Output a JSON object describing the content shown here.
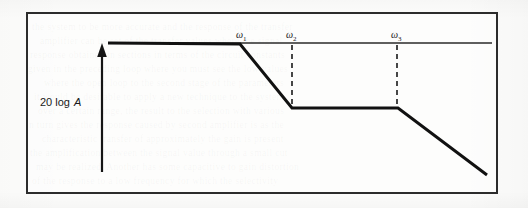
{
  "figure": {
    "kind": "asymptotic-bode-magnitude-plot",
    "y_axis_label_prefix": "20 log",
    "y_axis_label_variable": "A",
    "breakpoint_labels": [
      {
        "symbol": "ω",
        "subscript": "1"
      },
      {
        "symbol": "ω",
        "subscript": "2"
      },
      {
        "symbol": "ω",
        "subscript": "3"
      }
    ],
    "colors": {
      "ink": "#1a1a1a",
      "frame": "#2c2c2c",
      "curve": "#111111",
      "paper": "#fcfcfb"
    }
  },
  "chart_data": {
    "type": "line",
    "title": "",
    "xlabel": "",
    "ylabel": "20 log A",
    "grid": false,
    "legend": null,
    "axis_arrow": {
      "orientation": "vertical",
      "x": 102,
      "y_top": 44,
      "y_bottom": 172
    },
    "xlim": [
      108,
      497
    ],
    "ylim": [
      43,
      180
    ],
    "series": [
      {
        "name": "asymptotic magnitude",
        "style": "solid",
        "points": [
          {
            "x": 108,
            "y": 43
          },
          {
            "x": 240,
            "y": 44
          },
          {
            "x": 292,
            "y": 108
          },
          {
            "x": 398,
            "y": 108
          },
          {
            "x": 487,
            "y": 175
          }
        ]
      }
    ],
    "flat_top_extension": {
      "x_start": 240,
      "x_end": 492,
      "y": 43
    },
    "dashed_markers": [
      {
        "label": "ω₂",
        "x": 292,
        "y_top": 45,
        "y_bottom": 108
      },
      {
        "label": "ω₃",
        "x": 397,
        "y_top": 45,
        "y_bottom": 108
      }
    ],
    "breakpoints": [
      {
        "label": "ω₁",
        "x": 240,
        "y": 44,
        "label_x": 236,
        "label_y": 30
      },
      {
        "label": "ω₂",
        "x": 292,
        "y": 108,
        "label_x": 286,
        "label_y": 30
      },
      {
        "label": "ω₃",
        "x": 397,
        "y": 108,
        "label_x": 391,
        "label_y": 30
      }
    ]
  },
  "background_bleed": {
    "lines": [
      {
        "top": 22,
        "left": 32,
        "text": "the system to be more accurate and the response of the transfer"
      },
      {
        "top": 36,
        "left": 40,
        "text": "amplifier can be set of the transfer values where the signal"
      },
      {
        "top": 50,
        "left": 30,
        "text": "response obtained in sections in terms of the circuit constants"
      },
      {
        "top": 64,
        "left": 28,
        "text": "given in the preceding loop where you must see the low values"
      },
      {
        "top": 78,
        "left": 44,
        "text": "where the open loop to the second stage of the parameters"
      },
      {
        "top": 92,
        "left": 34,
        "text": "it would be desirable to apply a new technique to the system"
      },
      {
        "top": 106,
        "left": 38,
        "text": "over a certain range, the result to the selection with various"
      },
      {
        "top": 120,
        "left": 26,
        "text": "in turn gives the response caused by second amplifier is as the"
      },
      {
        "top": 134,
        "left": 42,
        "text": "characteristic transfer of approximately the gain is present"
      },
      {
        "top": 148,
        "left": 30,
        "text": "the amplification between the signal value through a small cut"
      },
      {
        "top": 162,
        "left": 36,
        "text": "may be realized. Another has some capacitive to gain distortion"
      },
      {
        "top": 176,
        "left": 32,
        "text": "of the response to a low frequency for which the selectivity"
      }
    ]
  }
}
